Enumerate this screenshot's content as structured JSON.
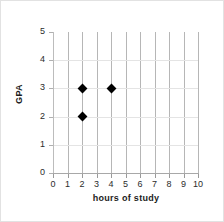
{
  "chart_data": {
    "type": "scatter",
    "title": "",
    "xlabel": "hours of study",
    "ylabel": "GPA",
    "xlim": [
      0,
      10
    ],
    "ylim": [
      0,
      5
    ],
    "xticks": [
      0,
      1,
      2,
      3,
      4,
      5,
      6,
      7,
      8,
      9,
      10
    ],
    "yticks": [
      0,
      1,
      2,
      3,
      4,
      5
    ],
    "xtick_labels": [
      "0",
      "1",
      "2",
      "3",
      "4",
      "5",
      "6",
      "7",
      "8",
      "9",
      "10"
    ],
    "ytick_labels": [
      "0",
      "1",
      "2",
      "3",
      "4",
      "5"
    ],
    "grid": {
      "vertical": true,
      "horizontal": true,
      "vertical_color": "#b6b6b6",
      "horizontal_color": "#e4e4e4"
    },
    "legend": null,
    "marker": {
      "shape": "diamond",
      "color": "#000000",
      "size": 7
    },
    "points": [
      {
        "x": 2,
        "y": 3
      },
      {
        "x": 2,
        "y": 2
      },
      {
        "x": 4,
        "y": 3
      }
    ]
  }
}
